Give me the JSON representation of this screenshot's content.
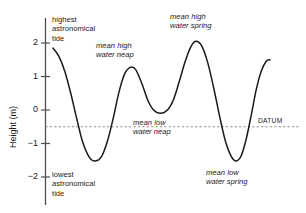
{
  "chart_data": {
    "type": "line",
    "title": "",
    "xlabel": "",
    "ylabel": "Height (m)",
    "ylim": [
      -2.45,
      2.35
    ],
    "xlim": [
      0,
      1
    ],
    "grid": false,
    "legend": "none",
    "y_ticks": [
      {
        "value": 2,
        "label": "2"
      },
      {
        "value": 1,
        "label": "1"
      },
      {
        "value": 0,
        "label": "0"
      },
      {
        "value": -1,
        "label": "−1"
      },
      {
        "value": -2,
        "label": "−2"
      }
    ],
    "x_axis_visible": false,
    "datum": {
      "value": -0.5,
      "label": "DATUM",
      "style": "dashed"
    },
    "series": [
      {
        "name": "tidal curve",
        "color": "#1a1a1a",
        "description": "Semi-diurnal tide curve showing spring and neap high and low waters",
        "points": [
          {
            "x": 0.0,
            "y": 1.85
          },
          {
            "x": 0.03,
            "y": 1.6
          },
          {
            "x": 0.06,
            "y": 1.15
          },
          {
            "x": 0.09,
            "y": 0.5
          },
          {
            "x": 0.12,
            "y": -0.25
          },
          {
            "x": 0.15,
            "y": -0.95
          },
          {
            "x": 0.185,
            "y": -1.42
          },
          {
            "x": 0.215,
            "y": -1.52
          },
          {
            "x": 0.245,
            "y": -1.4
          },
          {
            "x": 0.275,
            "y": -0.95
          },
          {
            "x": 0.305,
            "y": -0.25
          },
          {
            "x": 0.335,
            "y": 0.55
          },
          {
            "x": 0.365,
            "y": 1.1
          },
          {
            "x": 0.395,
            "y": 1.28
          },
          {
            "x": 0.42,
            "y": 1.2
          },
          {
            "x": 0.45,
            "y": 0.8
          },
          {
            "x": 0.48,
            "y": 0.3
          },
          {
            "x": 0.51,
            "y": 0.0
          },
          {
            "x": 0.545,
            "y": -0.1
          },
          {
            "x": 0.58,
            "y": 0.0
          },
          {
            "x": 0.61,
            "y": 0.3
          },
          {
            "x": 0.64,
            "y": 0.85
          },
          {
            "x": 0.67,
            "y": 1.45
          },
          {
            "x": 0.7,
            "y": 1.9
          },
          {
            "x": 0.725,
            "y": 2.05
          },
          {
            "x": 0.755,
            "y": 1.9
          },
          {
            "x": 0.785,
            "y": 1.4
          },
          {
            "x": 0.815,
            "y": 0.65
          },
          {
            "x": 0.845,
            "y": -0.2
          },
          {
            "x": 0.875,
            "y": -0.95
          },
          {
            "x": 0.905,
            "y": -1.4
          },
          {
            "x": 0.93,
            "y": -1.52
          },
          {
            "x": 0.955,
            "y": -1.35
          },
          {
            "x": 0.98,
            "y": -0.85
          },
          {
            "x": 1.005,
            "y": -0.15
          },
          {
            "x": 1.03,
            "y": 0.6
          },
          {
            "x": 1.055,
            "y": 1.15
          },
          {
            "x": 1.08,
            "y": 1.45
          },
          {
            "x": 1.1,
            "y": 1.5
          }
        ]
      }
    ],
    "annotations": [
      {
        "id": "highest-astronomical-tide",
        "text": "highest\nastronomical\ntide",
        "style": "upright",
        "at": {
          "x": 0.01,
          "y": 2.2
        }
      },
      {
        "id": "mean-high-water-neap",
        "text": "mean high\nwater neap",
        "style": "italic",
        "at": {
          "x": 0.3,
          "y": 1.95
        }
      },
      {
        "id": "mean-high-water-spring",
        "text": "mean high\nwater spring",
        "style": "italic",
        "at": {
          "x": 0.63,
          "y": 2.3
        }
      },
      {
        "id": "mean-low-water-neap",
        "text": "mean low\nwater neap",
        "style": "italic",
        "at": {
          "x": 0.43,
          "y": -0.35
        }
      },
      {
        "id": "mean-low-water-spring",
        "text": "mean low\nwater spring",
        "style": "italic",
        "at": {
          "x": 0.8,
          "y": -1.75
        }
      },
      {
        "id": "lowest-astronomical-tide",
        "text": "lowest\nastronomical\ntide",
        "style": "upright",
        "at": {
          "x": 0.01,
          "y": -1.95
        }
      }
    ]
  },
  "labels": {
    "y_axis_title": "Height (m)",
    "tick_2": "2",
    "tick_1": "1",
    "tick_0": "0",
    "tick_neg1": "−1",
    "tick_neg2": "−2",
    "datum": "DATUM",
    "highest_astronomical_tide": "highest\nastronomical\ntide",
    "lowest_astronomical_tide": "lowest\nastronomical\ntide",
    "mean_high_water_neap": "mean high\nwater neap",
    "mean_high_water_spring": "mean high\nwater spring",
    "mean_low_water_neap": "mean low\nwater neap",
    "mean_low_water_spring": "mean low\nwater spring"
  },
  "colors": {
    "curve": "#1a1a1a",
    "axis": "#4d4d4d",
    "datum_line": "#8c8c8c",
    "text": "#1a1a1a",
    "background": "#ffffff"
  }
}
